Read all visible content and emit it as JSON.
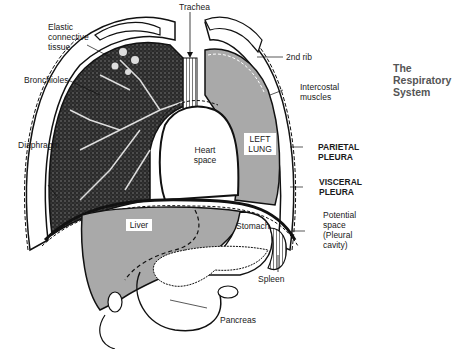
{
  "title": "The Respiratory\nSystem",
  "colors": {
    "organ_fill": "#a9a9a9",
    "lung_texture": "#2a2a2a",
    "outline": "#111111",
    "background": "#ffffff",
    "title_text": "#555555"
  },
  "labels": {
    "trachea": "Trachea",
    "elastic_connective_tissue": "Elastic\nconnective\ntissue",
    "second_rib": "2nd rib",
    "bronchioles": "Bronchioles",
    "intercostal_muscles": "Intercostal\nmuscles",
    "diaphragm": "Diaphragm",
    "parietal_pleura": "PARIETAL\nPLEURA",
    "visceral_pleura": "VISCERAL\nPLEURA",
    "potential_space": "Potential\nspace\n(Pleural\ncavity)",
    "heart_space": "Heart\nspace",
    "left_lung": "LEFT\nLUNG",
    "liver": "Liver",
    "stomach": "Stomach",
    "spleen": "Spleen",
    "pancreas": "Pancreas"
  }
}
